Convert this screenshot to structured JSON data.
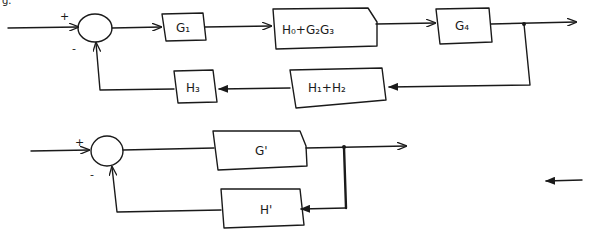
{
  "header_fragment": "g.",
  "top_diagram": {
    "summing_junction": {
      "plus_sign": "+",
      "minus_sign": "-"
    },
    "forward_blocks": [
      {
        "label": "G₁"
      },
      {
        "label": "H₀+G₂G₃"
      },
      {
        "label": "G₄"
      }
    ],
    "feedback_blocks": [
      {
        "label": "H₁+H₂"
      },
      {
        "label": "H₃"
      }
    ]
  },
  "bottom_diagram": {
    "summing_junction": {
      "plus_sign": "+",
      "minus_sign": "-"
    },
    "forward_block": {
      "label": "G'"
    },
    "feedback_block": {
      "label": "H'"
    }
  },
  "colors": {
    "ink": "#1a1a1a",
    "paper": "#ffffff"
  }
}
